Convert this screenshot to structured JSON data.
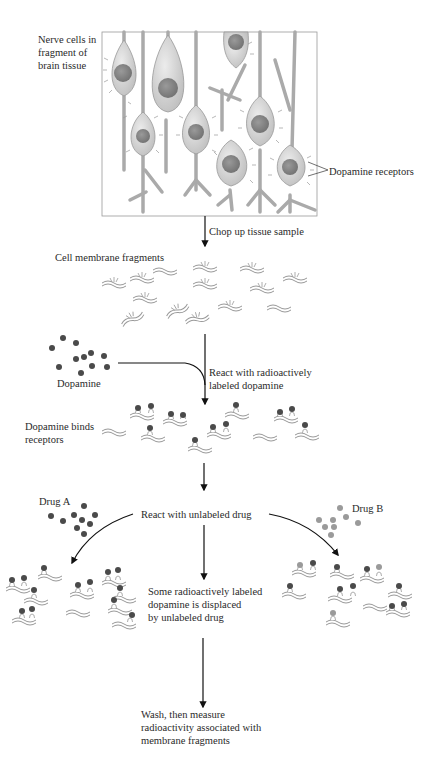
{
  "diagram": {
    "colors": {
      "dopamine": "#4a4a4a",
      "drug_a": "#4a4a4a",
      "drug_b": "#9a9a9a",
      "cell_fill": "#dcdcdc",
      "nucleus": "#8a8a8a",
      "membrane": "#999999",
      "arrow": "#111111"
    },
    "labels": {
      "nerve_cells": [
        "Nerve cells in",
        "fragment of",
        "brain tissue"
      ],
      "dopamine_receptors": "Dopamine receptors",
      "step1": "Chop up tissue sample",
      "membrane_fragments": "Cell membrane fragments",
      "dopamine": "Dopamine",
      "step2": [
        "React with radioactively",
        "labeled dopamine"
      ],
      "dopamine_binds": [
        "Dopamine binds",
        "receptors"
      ],
      "drug_a": "Drug A",
      "drug_b": "Drug B",
      "step3": "React with unlabeled drug",
      "displaced": [
        "Some radioactively labeled",
        "dopamine is displaced",
        "by unlabeled drug"
      ],
      "step4": [
        "Wash, then measure",
        "radioactivity associated with",
        "membrane fragments"
      ]
    }
  }
}
